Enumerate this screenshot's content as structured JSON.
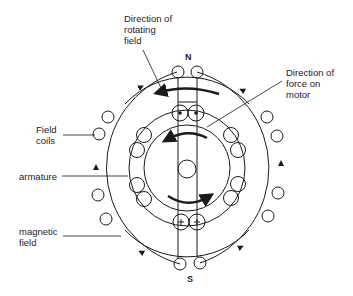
{
  "diagram": {
    "type": "electric motor cross-section",
    "labels": {
      "direction_rotating_field": "Direction of\nrotating\nfield",
      "direction_force": "Direction of\nforce on\nmotor",
      "field_coils": "Field\ncoils",
      "armature": "armature",
      "magnetic_field": "magnetic\nfield"
    },
    "poles": {
      "north": "N",
      "south": "S"
    },
    "conductor_symbols": {
      "top": "⊙",
      "bottom": "+"
    },
    "colors": {
      "line": "#1a1a1a",
      "background": "#ffffff"
    }
  }
}
